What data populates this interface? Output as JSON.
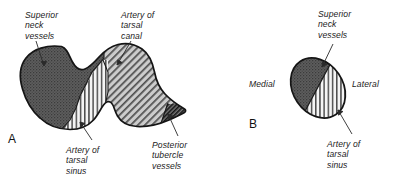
{
  "figure": {
    "background_color": "#ffffff",
    "outline_color": "#1a1a1a",
    "leader_line_color": "#2a2a2a",
    "panels": [
      {
        "letter": "A",
        "letter_x": 8,
        "letter_y": 132,
        "description": "Superior view of talus neck and body showing arterial supply zones"
      },
      {
        "letter": "B",
        "letter_x": 249,
        "letter_y": 117,
        "description": "Cross-section of talar neck showing medial to lateral arterial zones"
      }
    ],
    "regions": [
      {
        "name": "superior-neck-vessels-region",
        "panel": "A",
        "texture": "dotted",
        "fill_color": "#5e5e5e",
        "dot_color": "#3a3a3a"
      },
      {
        "name": "artery-of-tarsal-sinus-region",
        "panel": "A",
        "texture": "vertical-stripes",
        "fill_color": "#f2f2f2",
        "stripe_color": "#4a4a4a"
      },
      {
        "name": "artery-of-tarsal-canal-region",
        "panel": "A",
        "texture": "diagonal-hatch",
        "fill_color": "#c9c9c9",
        "stripe_color": "#4f4f4f"
      },
      {
        "name": "posterior-tubercle-vessels-region",
        "panel": "A",
        "texture": "dense-diagonal-hatch",
        "fill_color": "#6a6a6a",
        "stripe_color": "#1d1d1d"
      },
      {
        "name": "superior-neck-vessels-region",
        "panel": "B",
        "texture": "dotted",
        "fill_color": "#5e5e5e",
        "dot_color": "#3a3a3a"
      },
      {
        "name": "artery-of-tarsal-sinus-region",
        "panel": "B",
        "texture": "vertical-stripes",
        "fill_color": "#f2f2f2",
        "stripe_color": "#4a4a4a"
      }
    ],
    "labels": {
      "a_superior_neck_vessels": "Superior\nneck\nvessels",
      "a_artery_of_tarsal_canal": "Artery of\ntarsal\ncanal",
      "a_artery_of_tarsal_sinus": "Artery of\ntarsal\nsinus",
      "a_posterior_tubercle_vessels": "Posterior\ntubercle\nvessels",
      "b_superior_neck_vessels": "Superior\nneck\nvessels",
      "b_medial": "Medial",
      "b_lateral": "Lateral",
      "b_artery_of_tarsal_sinus": "Artery of\ntarsal\nsinus"
    }
  }
}
